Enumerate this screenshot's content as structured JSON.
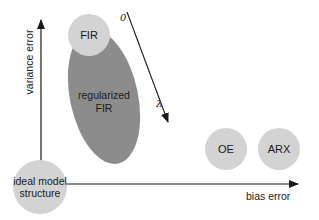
{
  "diagram": {
    "axes": {
      "y_label": "variance error",
      "x_label": "bias error"
    },
    "nodes": [
      {
        "id": "fir",
        "label": "FIR"
      },
      {
        "id": "regularized-fir",
        "label_line1": "regularized",
        "label_line2": "FIR"
      },
      {
        "id": "oe",
        "label": "OE"
      },
      {
        "id": "arx",
        "label": "ARX"
      },
      {
        "id": "ideal",
        "label_line1": "ideal model",
        "label_line2": "structure"
      }
    ],
    "regularization_arrow": {
      "start_label": "0",
      "end_label": "λ"
    },
    "colors": {
      "light_circle": "#d3d3d3",
      "dark_ellipse": "#8c8c8c",
      "axis": "#1a1a1a"
    }
  }
}
